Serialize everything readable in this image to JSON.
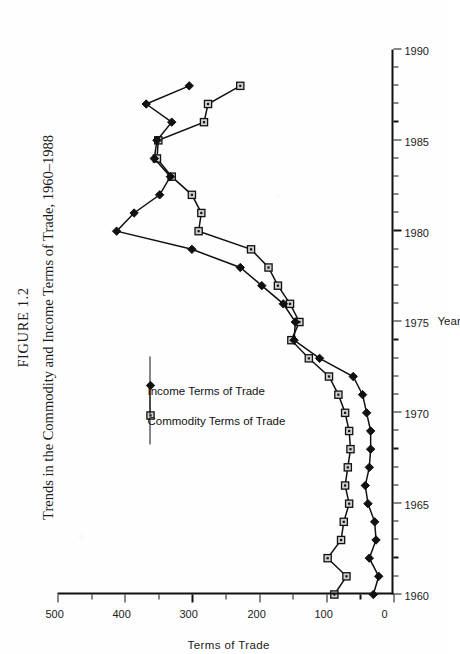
{
  "figure": {
    "label": "FIGURE 1.2",
    "caption": "Trends in the Commodity and Income Terms of Trade, 1960–1988",
    "orientation": "rotated-90-ccw",
    "ink_color": "#111111",
    "page_color": "#fefefe"
  },
  "legend": {
    "position": "upper-left-inside-plot",
    "items": [
      {
        "label": "Commodity Terms of Trade",
        "marker": "open-square"
      },
      {
        "label": "Income Terms of Trade",
        "marker": "filled-diamond"
      }
    ]
  },
  "chart_data": {
    "type": "line",
    "title": "Trends in the Commodity and Income Terms of Trade, 1960–1988",
    "xlabel": "Year",
    "ylabel": "Terms of Trade",
    "xlim": [
      1960,
      1990
    ],
    "ylim": [
      0,
      500
    ],
    "xticks": [
      1960,
      1965,
      1970,
      1975,
      1980,
      1985,
      1990
    ],
    "yticks": [
      0,
      100,
      200,
      300,
      400,
      500
    ],
    "xtick_minor_step": 1,
    "ytick_minor_step": 50,
    "grid": false,
    "legend_position": "upper left",
    "x": [
      1960,
      1961,
      1962,
      1963,
      1964,
      1965,
      1966,
      1967,
      1968,
      1969,
      1970,
      1971,
      1972,
      1973,
      1974,
      1975,
      1976,
      1977,
      1978,
      1979,
      1980,
      1981,
      1982,
      1983,
      1984,
      1985,
      1986,
      1987,
      1988
    ],
    "series": [
      {
        "name": "Commodity Terms of Trade",
        "marker": "open-square",
        "values": [
          88,
          70,
          98,
          78,
          74,
          66,
          72,
          68,
          64,
          66,
          72,
          82,
          96,
          126,
          152,
          140,
          154,
          172,
          186,
          212,
          290,
          286,
          300,
          330,
          352,
          350,
          282,
          276,
          228
        ]
      },
      {
        "name": "Income Terms of Trade",
        "marker": "filled-diamond",
        "values": [
          30,
          22,
          36,
          26,
          28,
          38,
          42,
          36,
          34,
          34,
          40,
          46,
          60,
          110,
          148,
          146,
          164,
          196,
          228,
          300,
          412,
          386,
          348,
          332,
          356,
          352,
          330,
          368,
          304
        ]
      }
    ]
  }
}
